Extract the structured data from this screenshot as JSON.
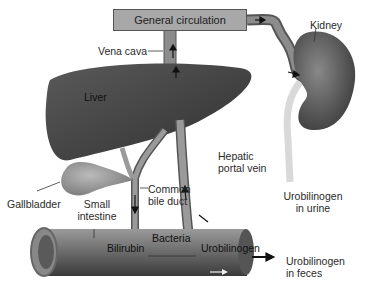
{
  "diagram": {
    "title_box": "General circulation",
    "labels": {
      "vena_cava": "Vena cava",
      "kidney": "Kidney",
      "liver": "Liver",
      "hepatic_portal_vein_line1": "Hepatic",
      "hepatic_portal_vein_line2": "portal vein",
      "gallbladder": "Gallbladder",
      "common_bile_duct_line1": "Common",
      "common_bile_duct_line2": "bile duct",
      "small_intestine_line1": "Small",
      "small_intestine_line2": "intestine",
      "urine_line1": "Urobilinogen",
      "urine_line2": "in urine",
      "bacteria": "Bacteria",
      "bilirubin": "Bilirubin",
      "urobilinogen": "Urobilinogen",
      "feces_line1": "Urobilinogen",
      "feces_line2": "in feces"
    },
    "colors": {
      "organ_dark": "#4a4a4a",
      "vessel": "#8c8c8c",
      "box": "#a8a8a8",
      "ureter": "#d9d9d9"
    }
  }
}
